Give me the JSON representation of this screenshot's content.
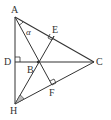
{
  "diagram": {
    "type": "geometry",
    "colors": {
      "stroke": "#333333",
      "angle_fill": "#bbbbbb",
      "background": "#ffffff"
    },
    "points": {
      "A": {
        "label": "A",
        "x": 15,
        "y": 17
      },
      "B": {
        "label": "B",
        "x": 38,
        "y": 62
      },
      "C": {
        "label": "C",
        "x": 94,
        "y": 62
      },
      "D": {
        "label": "D",
        "x": 15,
        "y": 62
      },
      "E": {
        "label": "E",
        "x": 54,
        "y": 36
      },
      "F": {
        "label": "F",
        "x": 52,
        "y": 85
      },
      "H": {
        "label": "H",
        "x": 15,
        "y": 104
      }
    },
    "angle_label": "α",
    "segments": [
      "AC",
      "AH",
      "DC",
      "AF",
      "HE",
      "HC",
      "BC"
    ],
    "right_angles": [
      "D",
      "E",
      "F"
    ]
  }
}
